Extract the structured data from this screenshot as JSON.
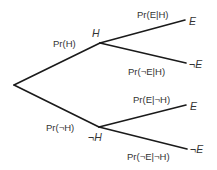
{
  "diagram": {
    "type": "probability-tree",
    "nodes": {
      "root": {
        "label": ""
      },
      "H": {
        "label": "H"
      },
      "notH": {
        "label": "¬H"
      },
      "H_E": {
        "label": "E"
      },
      "H_notE": {
        "label": "¬E"
      },
      "notH_E": {
        "label": "E"
      },
      "notH_notE": {
        "label": "¬E"
      }
    },
    "edges": {
      "root_H": {
        "label": "Pr(H)"
      },
      "root_notH": {
        "label": "Pr(¬H)"
      },
      "H_E": {
        "label": "Pr(E|H)"
      },
      "H_notE": {
        "label": "Pr(¬E|H)"
      },
      "notH_E": {
        "label": "Pr(E|¬H)"
      },
      "notH_notE": {
        "label": "Pr(¬E|¬H)"
      }
    }
  }
}
